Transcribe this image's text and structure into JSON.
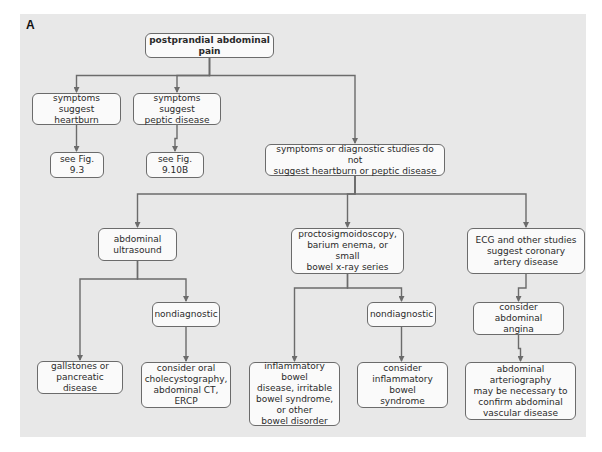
{
  "figure_label": "A",
  "colors": {
    "panel": "#e8e8e8",
    "box_fill": "#fafafa",
    "border": "#6b6b6b",
    "text": "#2a2a2a"
  },
  "nodes": {
    "root": "postprandial abdominal pain",
    "heartburn": "symptoms suggest\nheartburn",
    "peptic": "symptoms suggest\npeptic disease",
    "see_fig_9_3": "see Fig. 9.3",
    "see_fig_9_10b": "see Fig. 9.10B",
    "not_suggest": "symptoms or diagnostic studies do not\nsuggest heartburn or peptic disease",
    "abdominal_ultrasound": "abdominal\nultrasound",
    "proctosigmoidoscopy": "proctosigmoidoscopy,\nbarium enema, or small\nbowel x-ray series",
    "ecg": "ECG and other studies\nsuggest coronary\nartery disease",
    "nondiagnostic_1": "nondiagnostic",
    "nondiagnostic_2": "nondiagnostic",
    "consider_angina": "consider abdominal\nangina",
    "gallstones": "gallstones or\npancreatic disease",
    "oral_chole": "consider oral\ncholecystography,\nabdominal CT, ERCP",
    "ibd_disorders": "inflammatory bowel\ndisease, irritable\nbowel syndrome,\nor other\nbowel disorder",
    "consider_ibd": "consider\ninflammatory bowel\nsyndrome",
    "arteriography": "abdominal arteriography\nmay be necessary to\nconfirm abdominal\nvascular disease"
  },
  "edges": [
    [
      "root",
      "heartburn"
    ],
    [
      "root",
      "peptic"
    ],
    [
      "root",
      "not_suggest"
    ],
    [
      "heartburn",
      "see_fig_9_3"
    ],
    [
      "peptic",
      "see_fig_9_10b"
    ],
    [
      "not_suggest",
      "abdominal_ultrasound"
    ],
    [
      "not_suggest",
      "proctosigmoidoscopy"
    ],
    [
      "not_suggest",
      "ecg"
    ],
    [
      "abdominal_ultrasound",
      "gallstones"
    ],
    [
      "abdominal_ultrasound",
      "nondiagnostic_1"
    ],
    [
      "nondiagnostic_1",
      "oral_chole"
    ],
    [
      "proctosigmoidoscopy",
      "ibd_disorders"
    ],
    [
      "proctosigmoidoscopy",
      "nondiagnostic_2"
    ],
    [
      "nondiagnostic_2",
      "consider_ibd"
    ],
    [
      "ecg",
      "consider_angina"
    ],
    [
      "consider_angina",
      "arteriography"
    ]
  ]
}
